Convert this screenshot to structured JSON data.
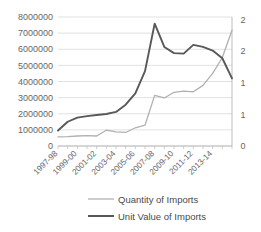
{
  "chart_data": {
    "type": "line",
    "title": "",
    "xlabel": "",
    "ylabel": "",
    "grid": true,
    "legend_position": "bottom",
    "x": [
      "1997-98",
      "1998-99",
      "1999-00",
      "2000-01",
      "2001-02",
      "2002-03",
      "2003-04",
      "2004-05",
      "2005-06",
      "2006-07",
      "2007-08",
      "2008-09",
      "2009-10",
      "2010-11",
      "2011-12",
      "2012-13",
      "2013-14",
      "2014-15",
      "2015-16"
    ],
    "x_tick_labels": [
      "1997-98",
      "1999-00",
      "2001-02",
      "2003-04",
      "2005-06",
      "2007-08",
      "2009-10",
      "2011-12",
      "2013-14"
    ],
    "left_axis": {
      "ticks": [
        "0",
        "1000000",
        "2000000",
        "3000000",
        "4000000",
        "5000000",
        "6000000",
        "7000000",
        "8000000"
      ],
      "min": 0,
      "max": 8000000,
      "step": 1000000
    },
    "right_axis": {
      "ticks": [
        "0",
        "1",
        "1",
        "2",
        "2"
      ],
      "tick_values": [
        0,
        0.5,
        1,
        1.5,
        2,
        2.5
      ],
      "min": 0,
      "max": 2.5,
      "step": 0.5
    },
    "series": [
      {
        "name": "Quantity of Imports",
        "axis": "left",
        "color": "#b0b0b0",
        "values": [
          560000,
          580000,
          620000,
          640000,
          620000,
          980000,
          880000,
          840000,
          1130000,
          1290000,
          3140000,
          2980000,
          3330000,
          3400000,
          3360000,
          3760000,
          4500000,
          5490000,
          7180000
        ]
      },
      {
        "name": "Unit Value of Imports",
        "axis": "right",
        "color": "#585858",
        "values": [
          0.3,
          0.47,
          0.55,
          0.58,
          0.6,
          0.62,
          0.66,
          0.8,
          1.02,
          1.45,
          2.37,
          1.92,
          1.8,
          1.79,
          1.96,
          1.92,
          1.85,
          1.7,
          1.31
        ]
      }
    ]
  },
  "legend": {
    "items": [
      {
        "label": "Quantity of Imports",
        "color": "#b0b0b0",
        "width": 1.3
      },
      {
        "label": "Unit Value of Imports",
        "color": "#585858",
        "width": 2.0
      }
    ]
  }
}
